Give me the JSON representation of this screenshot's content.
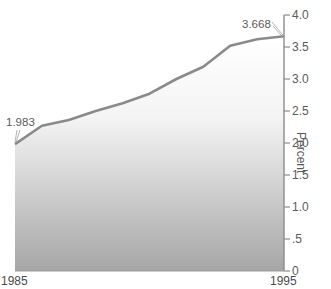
{
  "chart_data": {
    "type": "area",
    "title": "",
    "xlabel": "",
    "ylabel": "Percent",
    "x": [
      1985,
      1986,
      1987,
      1988,
      1989,
      1990,
      1991,
      1992,
      1993,
      1994,
      1995
    ],
    "series": [
      {
        "name": "Percent",
        "values": [
          1.983,
          2.27,
          2.36,
          2.5,
          2.62,
          2.77,
          3.0,
          3.19,
          3.52,
          3.62,
          3.668
        ]
      }
    ],
    "x_tick_labels": [
      "1985",
      "1995"
    ],
    "y_ticks": [
      0,
      0.5,
      1.0,
      1.5,
      2.0,
      2.5,
      3.0,
      3.5,
      4.0
    ],
    "y_tick_labels": [
      "0",
      ".5",
      "1.0",
      "1.5",
      "2.0",
      "2.5",
      "3.0",
      "3.5",
      "4.0"
    ],
    "annotations": [
      {
        "x": 1985,
        "value": 1.983,
        "label": "1.983"
      },
      {
        "x": 1995,
        "value": 3.668,
        "label": "3.668"
      }
    ],
    "ylim": [
      0,
      4.0
    ],
    "xlim": [
      1985,
      1995
    ],
    "grid": false,
    "legend": "none",
    "y_axis_position": "right",
    "colors": {
      "line": "#8a8a8a",
      "fill_top": "#ffffff",
      "fill_bottom": "#a6a6a6",
      "axis": "#8c8c8c"
    }
  }
}
